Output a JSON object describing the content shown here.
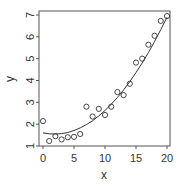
{
  "chart_data": {
    "type": "scatter",
    "title": "",
    "xlabel": "x",
    "ylabel": "y",
    "xlim": [
      0,
      20
    ],
    "ylim": [
      1,
      7
    ],
    "xticks": [
      0,
      5,
      10,
      15,
      20
    ],
    "yticks": [
      1,
      2,
      3,
      4,
      5,
      6,
      7
    ],
    "grid": false,
    "legend": null,
    "series": [
      {
        "name": "points",
        "type": "scatter",
        "marker": "open-circle",
        "x": [
          0,
          1,
          2,
          3,
          4,
          5,
          6,
          7,
          8,
          9,
          10,
          11,
          12,
          13,
          14,
          15,
          16,
          17,
          18,
          19,
          20
        ],
        "y": [
          2.14,
          1.23,
          1.45,
          1.3,
          1.4,
          1.42,
          1.55,
          2.8,
          2.35,
          2.7,
          2.42,
          2.8,
          3.47,
          3.33,
          3.85,
          4.82,
          5.0,
          5.64,
          6.05,
          6.73,
          6.95
        ]
      },
      {
        "name": "quadratic fit",
        "type": "line",
        "x": [
          0,
          1,
          2,
          3,
          4,
          5,
          6,
          7,
          8,
          9,
          10,
          11,
          12,
          13,
          14,
          15,
          16,
          17,
          18,
          19,
          20
        ],
        "y": [
          1.6,
          1.56,
          1.55,
          1.57,
          1.62,
          1.71,
          1.83,
          1.98,
          2.16,
          2.38,
          2.63,
          2.91,
          3.22,
          3.57,
          3.95,
          4.36,
          4.8,
          5.28,
          5.79,
          6.33,
          6.9
        ]
      }
    ]
  },
  "colors": {
    "axis": "#555555",
    "points": "#333333",
    "line": "#333333",
    "text": "#333333"
  }
}
